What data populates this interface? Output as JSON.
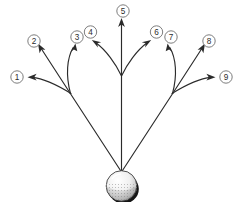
{
  "diagram": {
    "line_color": "#2b2b2b",
    "label_outline_color": "#6e6e6e",
    "background_color": "#ffffff",
    "ball": {
      "name": "golf-ball",
      "center_x": 121.5,
      "center_y": 186,
      "radius": 15.5,
      "fill": "#f2f2f2",
      "shadow_color": "#1a1a1a",
      "dimple_color": "#9a9a9a"
    },
    "origin": {
      "x": 121.5,
      "y": 172
    },
    "branch_left": {
      "x": 70,
      "y": 93
    },
    "branch_right": {
      "x": 173,
      "y": 93
    },
    "paths": [
      {
        "label": "1",
        "name": "flight-path-1",
        "d": "M121.5 172 L70 93",
        "curve": "M70 93 C 58 86, 44 79, 30.5 77.5",
        "arrow": {
          "x": 28.5,
          "y": 77.3,
          "angle": 188
        },
        "label_pos": {
          "x": 17,
          "y": 77
        }
      },
      {
        "label": "2",
        "name": "flight-path-2",
        "d": "M70 93 L38.5 45",
        "arrow": {
          "x": 37.5,
          "y": 43.5,
          "angle": 303
        },
        "label_pos": {
          "x": 34,
          "y": 41
        }
      },
      {
        "label": "3",
        "name": "flight-path-3",
        "d": "M70 93 C 66 74, 68 58, 74.5 45",
        "arrow": {
          "x": 75.5,
          "y": 43.5,
          "angle": 294
        },
        "label_pos": {
          "x": 77,
          "y": 37
        }
      },
      {
        "label": "4",
        "name": "flight-path-4",
        "d": "M121.5 74 C 114 62, 104 50, 93.5 41",
        "arrow": {
          "x": 92.5,
          "y": 40,
          "angle": 220
        },
        "label_pos": {
          "x": 91,
          "y": 33
        }
      },
      {
        "label": "5",
        "name": "flight-path-5",
        "d": "M121.5 172 L121.5 22",
        "arrow": {
          "x": 121.5,
          "y": 20,
          "angle": 270
        },
        "label_pos": {
          "x": 123,
          "y": 11
        }
      },
      {
        "label": "6",
        "name": "flight-path-6",
        "d": "M121.5 74 C 129 62, 139 50, 149.5 41",
        "arrow": {
          "x": 150.5,
          "y": 40,
          "angle": 320
        },
        "label_pos": {
          "x": 157,
          "y": 33
        }
      },
      {
        "label": "7",
        "name": "flight-path-7",
        "d": "M173 93 C 177 74, 175 58, 168.5 45",
        "arrow": {
          "x": 167.5,
          "y": 43.5,
          "angle": 246
        },
        "label_pos": {
          "x": 171,
          "y": 37
        }
      },
      {
        "label": "8",
        "name": "flight-path-8",
        "d": "M173 93 L204.5 45",
        "arrow": {
          "x": 205.5,
          "y": 43.5,
          "angle": 237
        },
        "label_pos": {
          "x": 209,
          "y": 41
        }
      },
      {
        "label": "9",
        "name": "flight-path-9",
        "d": "M173 93 C 185 86, 199 79, 212.5 77.5",
        "arrow": {
          "x": 214.5,
          "y": 77.3,
          "angle": 8
        },
        "label_pos": {
          "x": 226,
          "y": 77
        }
      }
    ],
    "stem_right": {
      "name": "flight-stem-right",
      "d": "M121.5 172 L173 93"
    }
  }
}
